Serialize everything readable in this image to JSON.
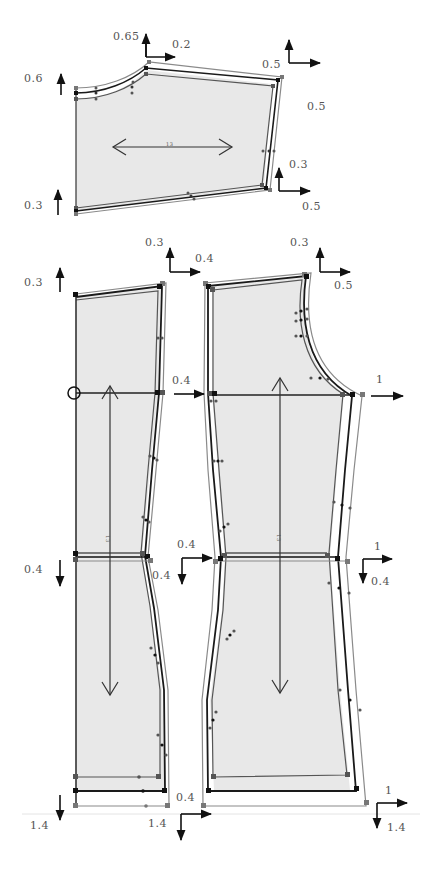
{
  "colors": {
    "fill": "#e8e8e8",
    "outline_dark": "#1a1a1a",
    "outline_mid": "#555555",
    "outline_light": "#8a8a8a",
    "arrow": "#111111",
    "label": "#555555"
  },
  "pieces": {
    "sleeve": {
      "name": "sleeve",
      "grainline": "horizontal",
      "grainline_mark": "13"
    },
    "back_bodice": {
      "name": "back-bodice",
      "grainline": "vertical",
      "grainline_mark": "13"
    },
    "front_bodice": {
      "name": "front-bodice",
      "grainline": "vertical",
      "grainline_mark": "13"
    }
  },
  "grade_labels": {
    "sleeve_cap_up": "0.65",
    "sleeve_cap_right": "0.2",
    "sleeve_left_top_up": "0.6",
    "sleeve_left_bottom_up": "0.3",
    "sleeve_right_top_up": "0.5",
    "sleeve_right_top_right": "0.5",
    "sleeve_right_bottom_up": "0.3",
    "sleeve_right_bottom_right": "0.5",
    "back_top_left_up": "0.3",
    "back_shoulder_up": "0.3",
    "back_shoulder_right": "0.4",
    "back_armhole_right": "0.4",
    "back_waist_left_down": "0.4",
    "back_waist_right_down": "0.4",
    "back_waist_right_right": "0.4",
    "back_hem_left_down": "1.4",
    "back_hem_right_down": "1.4",
    "back_hem_right_right": "0.4",
    "front_shoulder_up": "0.3",
    "front_shoulder_right": "0.5",
    "front_armhole_right": "1",
    "front_waist_right": "1",
    "front_waist_down": "0.4",
    "front_hem_right": "1",
    "front_hem_down": "1.4"
  }
}
